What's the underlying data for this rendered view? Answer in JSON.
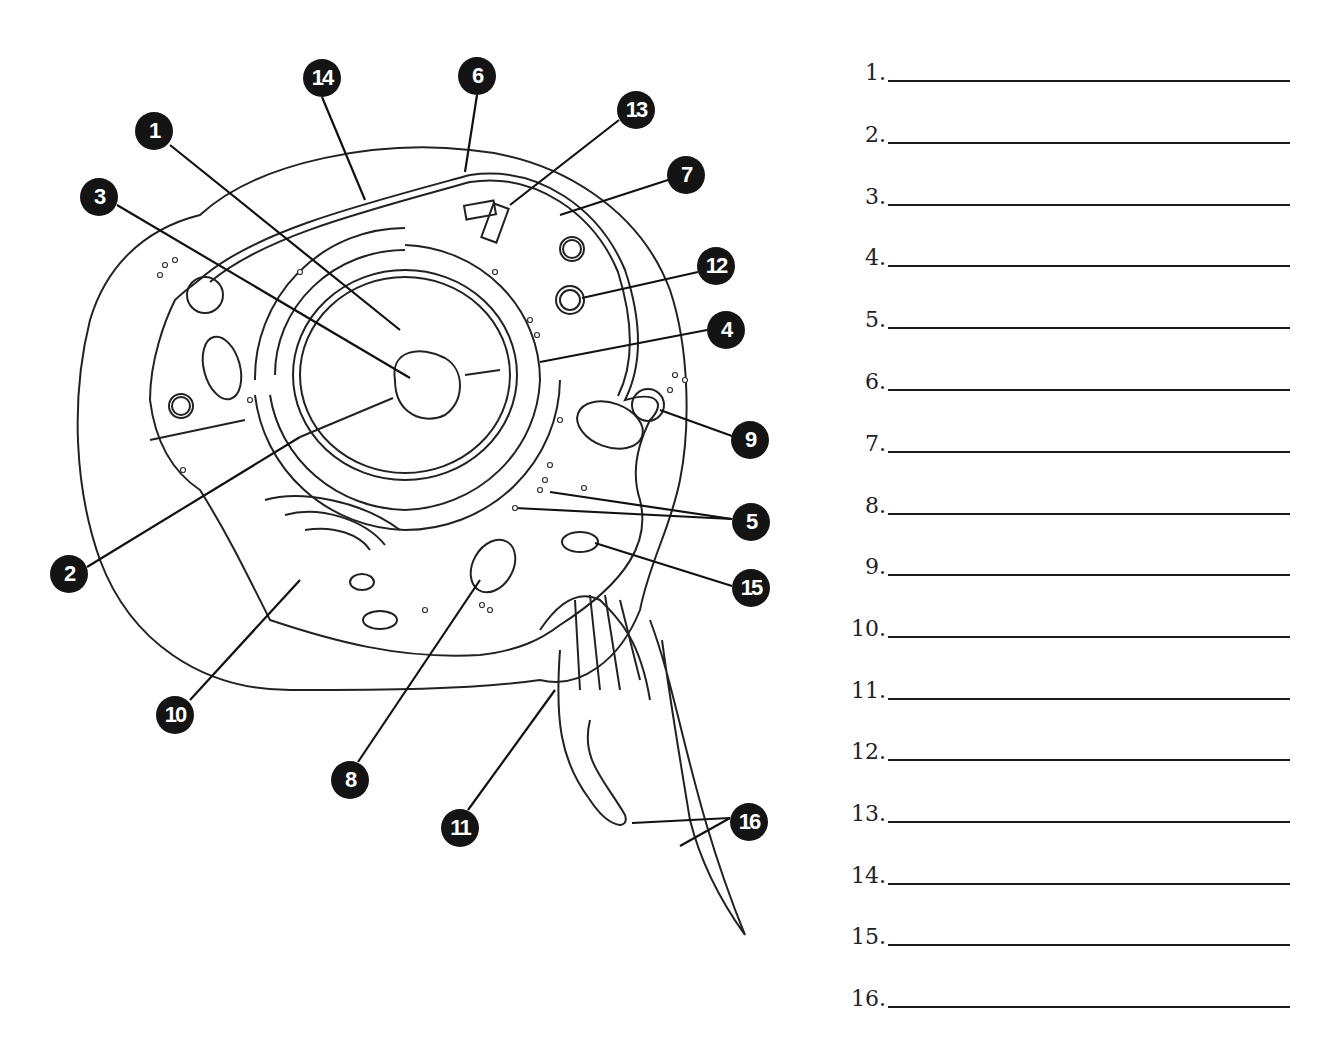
{
  "worksheet": {
    "title_cutoff": "",
    "diagram": {
      "subject": "animal-cell",
      "markers": [
        {
          "label": "1",
          "x": 154,
          "y": 131
        },
        {
          "label": "2",
          "x": 69,
          "y": 574
        },
        {
          "label": "3",
          "x": 99,
          "y": 197
        },
        {
          "label": "4",
          "x": 726,
          "y": 330
        },
        {
          "label": "5",
          "x": 751,
          "y": 522
        },
        {
          "label": "6",
          "x": 477,
          "y": 76
        },
        {
          "label": "7",
          "x": 686,
          "y": 175
        },
        {
          "label": "8",
          "x": 350,
          "y": 780
        },
        {
          "label": "9",
          "x": 750,
          "y": 440
        },
        {
          "label": "10",
          "x": 175,
          "y": 715
        },
        {
          "label": "11",
          "x": 460,
          "y": 828
        },
        {
          "label": "12",
          "x": 716,
          "y": 266
        },
        {
          "label": "13",
          "x": 636,
          "y": 110
        },
        {
          "label": "14",
          "x": 322,
          "y": 78
        },
        {
          "label": "15",
          "x": 751,
          "y": 588
        },
        {
          "label": "16",
          "x": 749,
          "y": 822
        }
      ]
    },
    "answers": [
      {
        "num": "1.",
        "value": ""
      },
      {
        "num": "2.",
        "value": ""
      },
      {
        "num": "3.",
        "value": ""
      },
      {
        "num": "4.",
        "value": ""
      },
      {
        "num": "5.",
        "value": ""
      },
      {
        "num": "6.",
        "value": ""
      },
      {
        "num": "7.",
        "value": ""
      },
      {
        "num": "8.",
        "value": ""
      },
      {
        "num": "9.",
        "value": ""
      },
      {
        "num": "10.",
        "value": ""
      },
      {
        "num": "11.",
        "value": ""
      },
      {
        "num": "12.",
        "value": ""
      },
      {
        "num": "13.",
        "value": ""
      },
      {
        "num": "14.",
        "value": ""
      },
      {
        "num": "15.",
        "value": ""
      },
      {
        "num": "16.",
        "value": ""
      }
    ]
  }
}
